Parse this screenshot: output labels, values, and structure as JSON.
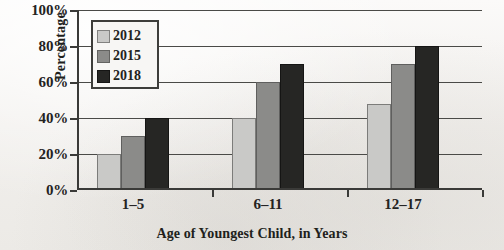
{
  "chart_data": {
    "type": "bar",
    "title": "",
    "xlabel": "Age of Youngest Child, in Years",
    "ylabel": "Percentage",
    "categories": [
      "1–5",
      "6–11",
      "12–17"
    ],
    "series": [
      {
        "name": "2012",
        "color": "#c9c9c7",
        "values": [
          20,
          40,
          48
        ]
      },
      {
        "name": "2015",
        "color": "#8b8b89",
        "values": [
          30,
          60,
          70
        ]
      },
      {
        "name": "2018",
        "color": "#262624",
        "values": [
          40,
          70,
          80
        ]
      }
    ],
    "ylim": [
      0,
      100
    ],
    "ytick_values": [
      0,
      20,
      40,
      60,
      80,
      100
    ],
    "ytick_labels": [
      "0%",
      "20%",
      "40%",
      "60%",
      "80%",
      "100%"
    ],
    "grid": true,
    "grid_axis": "y",
    "legend_position": "upper-left-inside",
    "value_suffix": "%"
  }
}
